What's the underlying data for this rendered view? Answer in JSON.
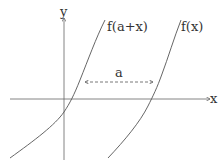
{
  "axes": {
    "x_label": "x",
    "y_label": "y"
  },
  "curves": [
    {
      "label": "f(a+x)"
    },
    {
      "label": "f(x)"
    }
  ],
  "shift": {
    "label": "a"
  },
  "colors": {
    "stroke": "#555555",
    "text": "#333333"
  }
}
